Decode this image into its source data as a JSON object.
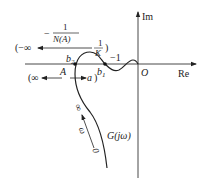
{
  "diagram": {
    "type": "nyquist-describing-function",
    "axes": {
      "imag_label": "Im",
      "real_label": "Re",
      "origin_label": "O"
    },
    "curve": {
      "label": "G(jω)",
      "omega_label": "ω",
      "omega_start": "0",
      "omega_end": "∞"
    },
    "points": {
      "b1": "b",
      "b1_sub": "1",
      "b2": "b",
      "b2_sub": "2",
      "A": "A",
      "minus_one": "−1"
    },
    "describing_function": {
      "label_minus": "−",
      "label_num": "1",
      "label_den": "N(A)",
      "top_left": "(−∞",
      "top_right_num": "1",
      "top_right_den": "K",
      "top_right_paren": ")",
      "bottom_left": "(∞",
      "bottom_right": "a",
      "bottom_right_paren": ")"
    }
  }
}
